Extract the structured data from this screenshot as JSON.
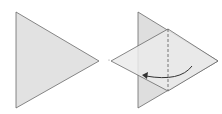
{
  "diagram": {
    "title": "",
    "steps": [
      {
        "name": "triangle",
        "description": "Right-pointing triangle"
      },
      {
        "name": "fold-flap-left",
        "description": "Triangle with flap folded over to the left along dashed valley line, curved arrow indicates fold direction"
      }
    ],
    "colors": {
      "paper": "#e2e2e2",
      "paper_flap": "#ececec",
      "stroke": "#6a6a6a",
      "arrow": "#333333",
      "background": "#ffffff"
    }
  }
}
